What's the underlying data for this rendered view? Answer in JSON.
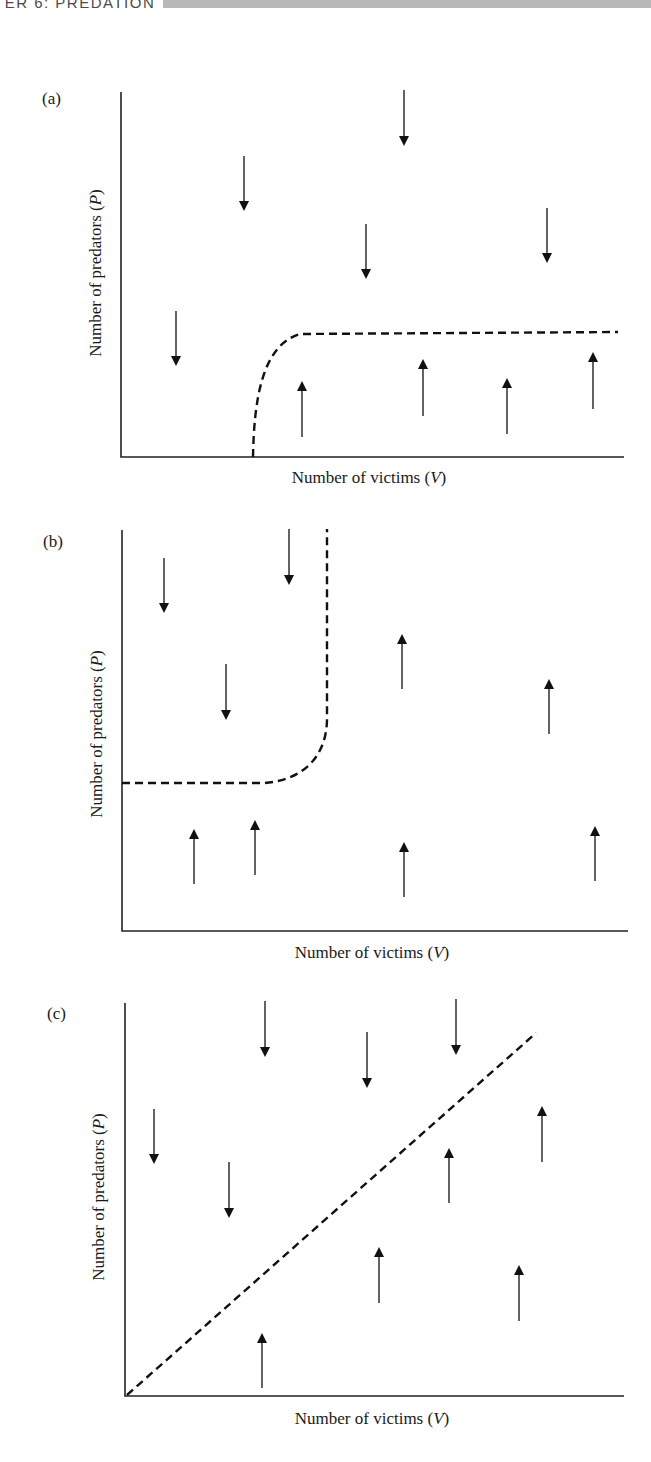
{
  "header": {
    "running_title": "TER 6: PREDATION",
    "bar_color": "#b8b8b8"
  },
  "chart_data": [
    {
      "type": "phase-plane",
      "panel_label": "(a)",
      "xlabel": "Number of victims (V)",
      "ylabel": "Number of predators (P)",
      "axes": {
        "origin": [
          121,
          457
        ],
        "x_end": 624,
        "y_top": 92
      },
      "isocline": {
        "style": "dashed",
        "shape": "rises steeply from V-axis then saturates to horizontal",
        "path": "M253,457 C254,400 262,345 300,334 L618,332"
      },
      "arrows": [
        {
          "dir": "down",
          "x": 176,
          "y1": 311,
          "y2": 366
        },
        {
          "dir": "down",
          "x": 244,
          "y1": 156,
          "y2": 211
        },
        {
          "dir": "down",
          "x": 366,
          "y1": 224,
          "y2": 279
        },
        {
          "dir": "down",
          "x": 404,
          "y1": 90,
          "y2": 146
        },
        {
          "dir": "down",
          "x": 547,
          "y1": 208,
          "y2": 263
        },
        {
          "dir": "up",
          "x": 302,
          "y1": 437,
          "y2": 381
        },
        {
          "dir": "up",
          "x": 423,
          "y1": 416,
          "y2": 359
        },
        {
          "dir": "up",
          "x": 507,
          "y1": 434,
          "y2": 378
        },
        {
          "dir": "up",
          "x": 593,
          "y1": 409,
          "y2": 352
        }
      ]
    },
    {
      "type": "phase-plane",
      "panel_label": "(b)",
      "xlabel": "Number of victims (V)",
      "ylabel": "Number of predators (P)",
      "axes": {
        "origin": [
          122,
          931
        ],
        "x_end": 628,
        "y_top": 530
      },
      "isocline": {
        "style": "dashed",
        "shape": "horizontal at low P, bends upward to vertical at intermediate V",
        "path": "M122,783 L265,783 C300,780 326,760 327,720 L327,529"
      },
      "arrows": [
        {
          "dir": "down",
          "x": 164,
          "y1": 558,
          "y2": 613
        },
        {
          "dir": "down",
          "x": 289,
          "y1": 529,
          "y2": 585
        },
        {
          "dir": "down",
          "x": 226,
          "y1": 664,
          "y2": 720
        },
        {
          "dir": "up",
          "x": 402,
          "y1": 689,
          "y2": 634
        },
        {
          "dir": "up",
          "x": 549,
          "y1": 734,
          "y2": 679
        },
        {
          "dir": "up",
          "x": 194,
          "y1": 884,
          "y2": 829
        },
        {
          "dir": "up",
          "x": 255,
          "y1": 875,
          "y2": 820
        },
        {
          "dir": "up",
          "x": 404,
          "y1": 897,
          "y2": 842
        },
        {
          "dir": "up",
          "x": 595,
          "y1": 881,
          "y2": 826
        }
      ]
    },
    {
      "type": "phase-plane",
      "panel_label": "(c)",
      "xlabel": "Number of victims (V)",
      "ylabel": "Number of predators (P)",
      "axes": {
        "origin": [
          125,
          1396
        ],
        "x_end": 624,
        "y_top": 1003
      },
      "isocline": {
        "style": "dashed",
        "shape": "straight line through origin with positive slope",
        "path": "M127,1395 L536,1033"
      },
      "arrows": [
        {
          "dir": "down",
          "x": 154,
          "y1": 1109,
          "y2": 1164
        },
        {
          "dir": "down",
          "x": 229,
          "y1": 1162,
          "y2": 1218
        },
        {
          "dir": "down",
          "x": 265,
          "y1": 1001,
          "y2": 1057
        },
        {
          "dir": "down",
          "x": 367,
          "y1": 1032,
          "y2": 1088
        },
        {
          "dir": "down",
          "x": 456,
          "y1": 999,
          "y2": 1055
        },
        {
          "dir": "up",
          "x": 449,
          "y1": 1203,
          "y2": 1148
        },
        {
          "dir": "up",
          "x": 542,
          "y1": 1162,
          "y2": 1106
        },
        {
          "dir": "up",
          "x": 379,
          "y1": 1303,
          "y2": 1247
        },
        {
          "dir": "up",
          "x": 519,
          "y1": 1321,
          "y2": 1265
        },
        {
          "dir": "up",
          "x": 262,
          "y1": 1388,
          "y2": 1333
        }
      ]
    }
  ],
  "panels": {
    "a": {
      "label": "(a)",
      "xlabel": "Number of victims (",
      "xlabel_var": "V",
      "ylabel": "Number of predators (",
      "ylabel_var": "P"
    },
    "b": {
      "label": "(b)",
      "xlabel": "Number of victims (",
      "xlabel_var": "V",
      "ylabel": "Number of predators (",
      "ylabel_var": "P"
    },
    "c": {
      "label": "(c)",
      "xlabel": "Number of victims (",
      "xlabel_var": "V",
      "ylabel": "Number of predators (",
      "ylabel_var": "P"
    }
  }
}
